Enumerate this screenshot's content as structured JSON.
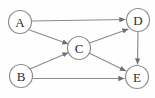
{
  "figure": {
    "background_color": "#fefefe",
    "width": 155,
    "height": 98
  },
  "style": {
    "node_fill": "#ffffff",
    "node_stroke": "#8d8d8d",
    "edge_color": "#8a8a8a",
    "label_color": "#2b2b2b",
    "node_radius": 11.5,
    "arrowhead": "filled-triangle"
  },
  "graph": {
    "type": "directed",
    "node_count": 5,
    "edge_count": 7,
    "nodes": [
      {
        "id": "A",
        "label": "A",
        "cx": 20,
        "cy": 22,
        "r": 11.5
      },
      {
        "id": "B",
        "label": "B",
        "cx": 21,
        "cy": 76,
        "r": 11.5
      },
      {
        "id": "C",
        "label": "C",
        "cx": 79,
        "cy": 48,
        "r": 11.5
      },
      {
        "id": "D",
        "label": "D",
        "cx": 138,
        "cy": 20,
        "r": 11.5
      },
      {
        "id": "E",
        "label": "E",
        "cx": 137,
        "cy": 77,
        "r": 11.5
      }
    ],
    "edges": [
      {
        "id": "A-D",
        "from": "A",
        "to": "D",
        "directed": true,
        "x1": 31.5,
        "y1": 21.0,
        "x2": 125.5,
        "y2": 19.5
      },
      {
        "id": "A-C",
        "from": "A",
        "to": "C",
        "directed": true,
        "x1": 29.5,
        "y1": 30.0,
        "x2": 68.5,
        "y2": 44.0
      },
      {
        "id": "B-C",
        "from": "B",
        "to": "C",
        "directed": true,
        "x1": 30.0,
        "y1": 69.0,
        "x2": 68.5,
        "y2": 52.5
      },
      {
        "id": "B-E",
        "from": "B",
        "to": "E",
        "directed": true,
        "x1": 32.5,
        "y1": 78.5,
        "x2": 124.5,
        "y2": 78.5
      },
      {
        "id": "C-D",
        "from": "C",
        "to": "D",
        "directed": true,
        "x1": 89.5,
        "y1": 43.0,
        "x2": 128.5,
        "y2": 29.0
      },
      {
        "id": "C-E",
        "from": "C",
        "to": "E",
        "directed": true,
        "x1": 89.0,
        "y1": 53.0,
        "x2": 126.0,
        "y2": 71.0
      },
      {
        "id": "D-E",
        "from": "D",
        "to": "E",
        "directed": true,
        "x1": 138.0,
        "y1": 31.5,
        "x2": 137.5,
        "y2": 64.5
      }
    ]
  }
}
